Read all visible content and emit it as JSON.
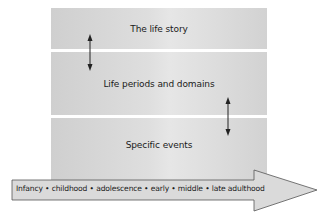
{
  "diagram": {
    "levels": [
      {
        "label": "The life story"
      },
      {
        "label": "Life periods and domains"
      },
      {
        "label": "Specific events"
      }
    ],
    "connectors": [
      {
        "between": [
          "The life story",
          "Life periods and domains"
        ],
        "type": "bidirectional-arrow"
      },
      {
        "between": [
          "Life periods and domains",
          "Specific events"
        ],
        "type": "bidirectional-arrow"
      }
    ],
    "timeline": {
      "label": "Infancy • childhood • adolescence • early • middle • late adulthood",
      "stages": [
        "Infancy",
        "childhood",
        "adolescence",
        "early",
        "middle",
        "late adulthood"
      ],
      "direction": "right"
    },
    "colors": {
      "box_fill": "#d9d9d9",
      "arrow_fill": "#dcdcdc",
      "stroke": "#444444",
      "background": "#ffffff"
    }
  }
}
